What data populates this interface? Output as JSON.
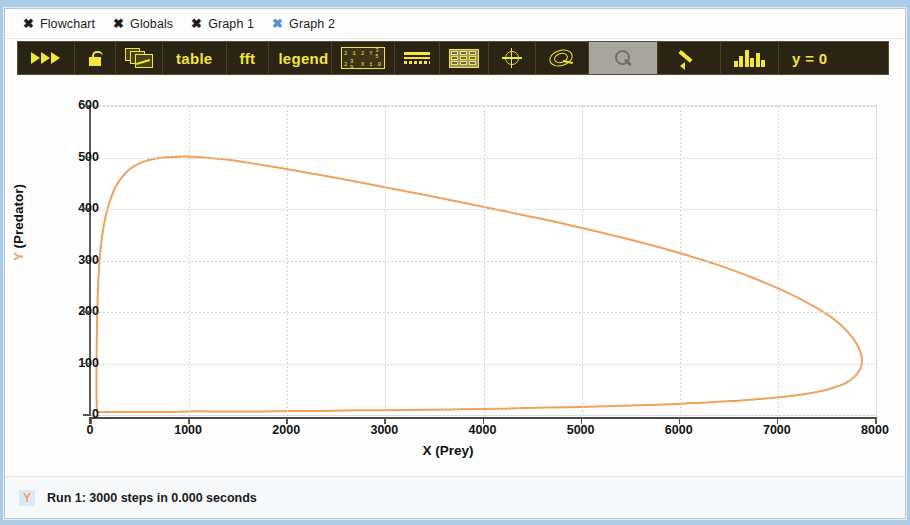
{
  "tabs": [
    {
      "label": "Flowchart",
      "active": false
    },
    {
      "label": "Globals",
      "active": false
    },
    {
      "label": "Graph 1",
      "active": false
    },
    {
      "label": "Graph 2",
      "active": true
    }
  ],
  "toolbar": {
    "run_label": "run-icon",
    "lock_label": "unlock-icon",
    "pages_label": "graph-pages-icon",
    "table_label": "table",
    "fft_label": "fft",
    "legend_label": "legend",
    "numgrid_cells": [
      "2",
      "1",
      "2",
      "Y",
      "3 5",
      "2",
      "3 9",
      "X",
      "1",
      "0"
    ],
    "lines_label": "lines-icon",
    "grid_label": "grid-icon",
    "crosshair_label": "crosshair-icon",
    "spiral_label": "phase-plot-icon",
    "zoom_label": "magnifier-icon",
    "pencil_label": "pencil-icon",
    "histogram_label": "histogram-icon",
    "yzero_label": "y = 0"
  },
  "status": {
    "badge": "Y",
    "text": "Run 1: 3000 steps in 0.000 seconds"
  },
  "chart_data": {
    "type": "line",
    "title": "",
    "xlabel": "X (Prey)",
    "ylabel": "Y (Predator)",
    "ylabel_prefix": "Y",
    "ylabel_rest": " (Predator)",
    "xlim": [
      0,
      8000
    ],
    "ylim": [
      0,
      600
    ],
    "xticks": [
      0,
      1000,
      2000,
      3000,
      4000,
      5000,
      6000,
      7000,
      8000
    ],
    "yticks": [
      0,
      100,
      200,
      300,
      400,
      500,
      600
    ],
    "grid": true,
    "legend": null,
    "series": [
      {
        "name": "Predator-Prey limit cycle",
        "color": "#f0a15c",
        "points": [
          [
            60,
            6
          ],
          [
            58,
            20
          ],
          [
            56,
            45
          ],
          [
            56,
            80
          ],
          [
            57,
            120
          ],
          [
            60,
            165
          ],
          [
            66,
            215
          ],
          [
            76,
            265
          ],
          [
            92,
            310
          ],
          [
            115,
            350
          ],
          [
            148,
            385
          ],
          [
            192,
            415
          ],
          [
            250,
            443
          ],
          [
            320,
            463
          ],
          [
            400,
            478
          ],
          [
            490,
            488
          ],
          [
            590,
            495
          ],
          [
            700,
            499
          ],
          [
            820,
            501
          ],
          [
            950,
            502
          ],
          [
            1080,
            501
          ],
          [
            1220,
            499
          ],
          [
            1380,
            496
          ],
          [
            1560,
            491
          ],
          [
            1760,
            485
          ],
          [
            1980,
            478
          ],
          [
            2220,
            470
          ],
          [
            2480,
            461
          ],
          [
            2760,
            451
          ],
          [
            3060,
            440
          ],
          [
            3380,
            428
          ],
          [
            3720,
            415
          ],
          [
            4080,
            401
          ],
          [
            4460,
            386
          ],
          [
            4850,
            370
          ],
          [
            5250,
            352
          ],
          [
            5650,
            333
          ],
          [
            6040,
            312
          ],
          [
            6410,
            290
          ],
          [
            6750,
            266
          ],
          [
            7060,
            241
          ],
          [
            7330,
            215
          ],
          [
            7550,
            189
          ],
          [
            7710,
            162
          ],
          [
            7810,
            136
          ],
          [
            7855,
            112
          ],
          [
            7845,
            92
          ],
          [
            7790,
            76
          ],
          [
            7700,
            63
          ],
          [
            7580,
            54
          ],
          [
            7430,
            46
          ],
          [
            7250,
            40
          ],
          [
            7040,
            35
          ],
          [
            6800,
            31
          ],
          [
            6530,
            27
          ],
          [
            6240,
            24
          ],
          [
            5930,
            21
          ],
          [
            5600,
            19
          ],
          [
            5250,
            17
          ],
          [
            4890,
            15
          ],
          [
            4520,
            14
          ],
          [
            4150,
            12
          ],
          [
            3780,
            11
          ],
          [
            3410,
            10
          ],
          [
            3050,
            9
          ],
          [
            2700,
            9
          ],
          [
            2360,
            8
          ],
          [
            2040,
            8
          ],
          [
            1740,
            7
          ],
          [
            1460,
            7
          ],
          [
            1210,
            7
          ],
          [
            990,
            7
          ],
          [
            800,
            6
          ],
          [
            640,
            6
          ],
          [
            500,
            6
          ],
          [
            390,
            6
          ],
          [
            300,
            6
          ],
          [
            230,
            6
          ],
          [
            175,
            6
          ],
          [
            135,
            6
          ],
          [
            105,
            6
          ],
          [
            82,
            6
          ],
          [
            68,
            6
          ],
          [
            60,
            6
          ]
        ]
      }
    ]
  }
}
